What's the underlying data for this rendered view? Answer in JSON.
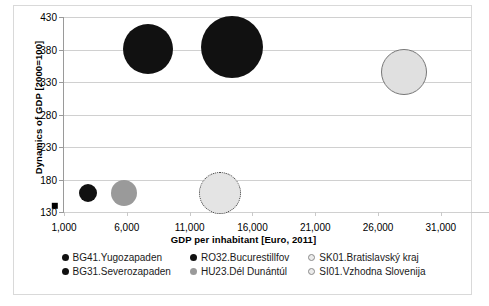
{
  "chart_data": {
    "type": "scatter",
    "title": "",
    "xlabel": "GDP per inhabitant [Euro, 2011]",
    "ylabel": "Dynamics of GDP [2000=100]",
    "xlim": [
      1000,
      33400
    ],
    "ylim": [
      130,
      430
    ],
    "xticks": [
      "1,000",
      "6,000",
      "11,000",
      "16,000",
      "21,000",
      "26,000",
      "31,000"
    ],
    "xtick_values": [
      1000,
      6000,
      11000,
      16000,
      21000,
      26000,
      31000
    ],
    "yticks": [
      "130",
      "180",
      "230",
      "280",
      "330",
      "380",
      "430"
    ],
    "ytick_values": [
      130,
      180,
      230,
      280,
      330,
      380,
      430
    ],
    "grid": true,
    "legend_position": "bottom",
    "series": [
      {
        "name": "BG41.Yugozapaden",
        "color": "#111111",
        "marker": "square",
        "points": [
          {
            "x": 250,
            "y": 140,
            "r": 4
          }
        ]
      },
      {
        "name": "BG31.Severozapaden",
        "color": "#111111",
        "marker": "circle",
        "points": [
          {
            "x": 2900,
            "y": 159,
            "r": 9
          }
        ]
      },
      {
        "name": "RO32.Bucurestillfov",
        "color": "#111111",
        "marker": "circle",
        "points": [
          {
            "x": 7650,
            "y": 381,
            "r": 25
          },
          {
            "x": 14400,
            "y": 384,
            "r": 31
          }
        ]
      },
      {
        "name": "HU23.Dél Dunántúl",
        "color": "#9a9a9a",
        "marker": "circle",
        "points": [
          {
            "x": 5800,
            "y": 159,
            "r": 13
          }
        ]
      },
      {
        "name": "SK01.Bratislavský kraj",
        "color": "#e0e0e0",
        "edge": "#777777",
        "marker": "circle",
        "points": [
          {
            "x": 28100,
            "y": 345,
            "r": 23
          }
        ]
      },
      {
        "name": "SI01.Vzhodna Slovenija",
        "color": "#e4e4e4",
        "edge": "#333333",
        "edge_style": "dotted",
        "marker": "circle",
        "points": [
          {
            "x": 13400,
            "y": 159,
            "r": 21
          }
        ]
      }
    ]
  },
  "legend": {
    "items": [
      {
        "label": "BG41.Yugozapaden",
        "swatch": "black"
      },
      {
        "label": "RO32.Bucurestillfov",
        "swatch": "black"
      },
      {
        "label": "SK01.Bratislavský kraj",
        "swatch": "lightgray-outline"
      },
      {
        "label": "BG31.Severozapaden",
        "swatch": "black"
      },
      {
        "label": "HU23.Dél Dunántúl",
        "swatch": "gray"
      },
      {
        "label": "SI01.Vzhodna Slovenija",
        "swatch": "lightgray-outline"
      }
    ]
  },
  "colors": {
    "black": "#111111",
    "gray": "#9a9a9a",
    "lightgray": "#e0e0e0",
    "gridline": "#d0d0d0",
    "axis": "#9a9a9a",
    "frame": "#d9d9d9"
  }
}
